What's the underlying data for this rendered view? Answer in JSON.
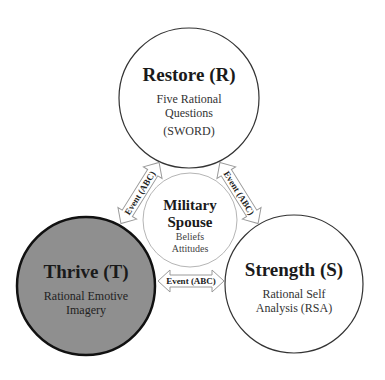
{
  "diagram": {
    "center": {
      "title_line1": "Military",
      "title_line2": "Spouse",
      "sub_line1": "Beliefs",
      "sub_line2": "Attitudes"
    },
    "nodes": [
      {
        "title": "Restore (R)",
        "sub_line1": "Five Rational",
        "sub_line2": "Questions",
        "sub_line3": "(SWORD)",
        "fill": "#ffffff"
      },
      {
        "title": "Thrive (T)",
        "sub_line1": "Rational Emotive",
        "sub_line2": "Imagery",
        "fill": "#8f8f8f"
      },
      {
        "title": "Strength (S)",
        "sub_line1": "Rational Self",
        "sub_line2": "Analysis (RSA)",
        "fill": "#ffffff"
      }
    ],
    "arrows": [
      {
        "label": "Event (ABC)",
        "connects": "Thrive-Restore"
      },
      {
        "label": "Event (ABC)",
        "connects": "Restore-Strength"
      },
      {
        "label": "Event (ABC)",
        "connects": "Thrive-Strength"
      }
    ]
  }
}
